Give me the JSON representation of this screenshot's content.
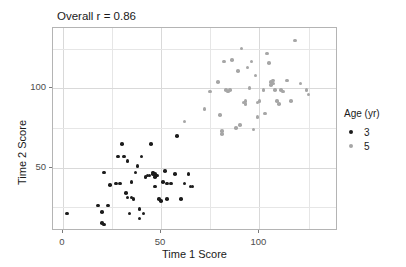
{
  "chart_data": {
    "type": "scatter",
    "title": "Overall r = 0.86",
    "xlabel": "Time 1 Score",
    "ylabel": "Time 2 Score",
    "xlim": [
      -5,
      140
    ],
    "ylim": [
      10,
      138
    ],
    "xticks": [
      0,
      50,
      100
    ],
    "yticks": [
      50,
      100
    ],
    "xtick_labels": [
      "0",
      "50",
      "100"
    ],
    "ytick_labels": [
      "50",
      "100"
    ],
    "grid": true,
    "legend_position": "right",
    "legend": {
      "title": "Age (yr)",
      "entries": [
        {
          "label": "3",
          "color": "#1c1c1c"
        },
        {
          "label": "5",
          "color": "#a6a6a6"
        }
      ]
    },
    "series": [
      {
        "name": "3",
        "color": "#1c1c1c",
        "points": [
          [
            2,
            21
          ],
          [
            18,
            26
          ],
          [
            20,
            22
          ],
          [
            20,
            15
          ],
          [
            21,
            14
          ],
          [
            21,
            47
          ],
          [
            24,
            39
          ],
          [
            27,
            40
          ],
          [
            28,
            57
          ],
          [
            30,
            65
          ],
          [
            31,
            57
          ],
          [
            32,
            34
          ],
          [
            33,
            31
          ],
          [
            33,
            54
          ],
          [
            34,
            21
          ],
          [
            35,
            41
          ],
          [
            36,
            30
          ],
          [
            37,
            47
          ],
          [
            38,
            51
          ],
          [
            39,
            24
          ],
          [
            39,
            18
          ],
          [
            40,
            57
          ],
          [
            41,
            21
          ],
          [
            42,
            44
          ],
          [
            44,
            45
          ],
          [
            45,
            65
          ],
          [
            46,
            47
          ],
          [
            46,
            46
          ],
          [
            47,
            46
          ],
          [
            47,
            44
          ],
          [
            47,
            38
          ],
          [
            48,
            45
          ],
          [
            49,
            30
          ],
          [
            50,
            29
          ],
          [
            51,
            41
          ],
          [
            52,
            48
          ],
          [
            53,
            40
          ],
          [
            55,
            40
          ],
          [
            57,
            46
          ],
          [
            58,
            70
          ],
          [
            60,
            30
          ],
          [
            62,
            40
          ],
          [
            64,
            46
          ],
          [
            65,
            38
          ],
          [
            66,
            38
          ],
          [
            29,
            40
          ],
          [
            35,
            31
          ],
          [
            43,
            45
          ],
          [
            53,
            30
          ],
          [
            23,
            26
          ]
        ]
      },
      {
        "name": "5",
        "color": "#a6a6a6",
        "points": [
          [
            62,
            79
          ],
          [
            72,
            87
          ],
          [
            75,
            98
          ],
          [
            79,
            104
          ],
          [
            80,
            83
          ],
          [
            81,
            71
          ],
          [
            81,
            73
          ],
          [
            82,
            117
          ],
          [
            83,
            99
          ],
          [
            85,
            99
          ],
          [
            86,
            118
          ],
          [
            88,
            75
          ],
          [
            89,
            111
          ],
          [
            90,
            77
          ],
          [
            91,
            125
          ],
          [
            92,
            91
          ],
          [
            93,
            92
          ],
          [
            93,
            90
          ],
          [
            94,
            113
          ],
          [
            95,
            100
          ],
          [
            96,
            117
          ],
          [
            97,
            74
          ],
          [
            98,
            108
          ],
          [
            99,
            82
          ],
          [
            100,
            92
          ],
          [
            102,
            99
          ],
          [
            104,
            122
          ],
          [
            105,
            116
          ],
          [
            106,
            104
          ],
          [
            106,
            102
          ],
          [
            107,
            105
          ],
          [
            108,
            99
          ],
          [
            109,
            92
          ],
          [
            110,
            90
          ],
          [
            111,
            99
          ],
          [
            112,
            98
          ],
          [
            114,
            105
          ],
          [
            116,
            92
          ],
          [
            118,
            130
          ],
          [
            121,
            103
          ],
          [
            124,
            99
          ],
          [
            125,
            96
          ],
          [
            84,
            98
          ],
          [
            103,
            84
          ],
          [
            107,
            103
          ],
          [
            99,
            91
          ]
        ]
      }
    ]
  }
}
